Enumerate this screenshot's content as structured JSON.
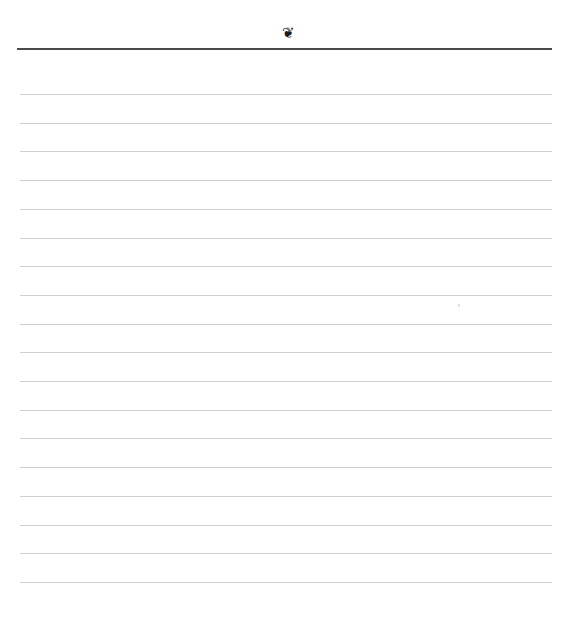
{
  "page": {
    "type": "blank lined notebook page",
    "header": {
      "ornament_icon": "floral-heart-icon",
      "ornament_glyph": "❦",
      "rule_color": "#4a4a4a"
    },
    "ruled_lines": {
      "count": 18,
      "first_y": 94,
      "spacing": 28.7,
      "color": "#cfcfcf"
    }
  }
}
